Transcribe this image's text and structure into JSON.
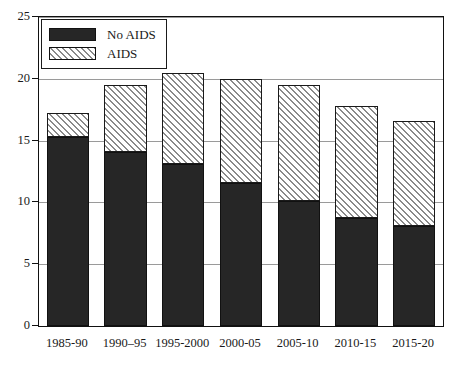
{
  "chart_data": {
    "type": "bar",
    "stacked": true,
    "title": "",
    "subtitle": "",
    "xlabel": "",
    "ylabel": "",
    "categories": [
      "1985-90",
      "1990–95",
      "1995-2000",
      "2000-05",
      "2005-10",
      "2010-15",
      "2015-20"
    ],
    "series": [
      {
        "name": "No AIDS",
        "fill": "solid",
        "color": "#262626",
        "values": [
          15.3,
          14.1,
          13.1,
          11.6,
          10.1,
          8.7,
          8.1
        ]
      },
      {
        "name": "AIDS",
        "fill": "hatch-diagonal",
        "color": "#ffffff",
        "values": [
          1.9,
          5.4,
          7.4,
          8.4,
          9.4,
          9.1,
          8.5
        ]
      }
    ],
    "totals": [
      17.2,
      19.5,
      20.5,
      20.0,
      19.5,
      17.8,
      16.6
    ],
    "ylim": [
      0,
      25
    ],
    "yticks": [
      0,
      5,
      10,
      15,
      20,
      25
    ],
    "ytick_labels": [
      "0",
      "5",
      "10",
      "15",
      "20",
      "25"
    ],
    "grid": true,
    "grid_axis": "y",
    "legend_position": "top-left"
  },
  "legend": {
    "entries": [
      {
        "label": "No AIDS",
        "swatch": "solid-dark-swatch"
      },
      {
        "label": "AIDS",
        "swatch": "hatched-swatch"
      }
    ]
  },
  "colors": {
    "bar_solid": "#262626",
    "bar_hatch_line": "#8a8a8a",
    "bar_hatch_bg": "#ffffff",
    "grid": "#9a9a9a",
    "frame": "#111111",
    "text": "#1a1a1a",
    "background": "#ffffff"
  }
}
